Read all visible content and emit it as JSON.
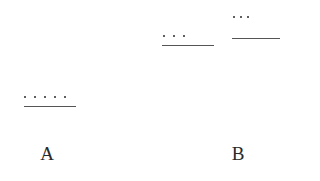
{
  "diagram": {
    "groups": [
      {
        "id": "A-group",
        "dot_count": 5,
        "dots_text": "•••••",
        "dots_y": 97,
        "dots_x_start": 24,
        "dot_spacing": 10,
        "line": {
          "x": 24,
          "y": 107,
          "width": 52
        }
      },
      {
        "id": "B-group-1",
        "dot_count": 3,
        "dots_text": "•••",
        "dots_y": 36,
        "dots_x_start": 163,
        "dot_spacing": 10,
        "line": {
          "x": 162,
          "y": 46,
          "width": 52
        }
      },
      {
        "id": "B-group-2",
        "dot_count": 3,
        "dots_text": "•••",
        "dots_y": 17,
        "dots_x_start": 233,
        "dot_spacing": 8,
        "line": {
          "x": 232,
          "y": 39,
          "width": 48
        }
      }
    ],
    "labels": [
      {
        "text": "A",
        "x": 47,
        "y": 145
      },
      {
        "text": "B",
        "x": 238,
        "y": 145
      }
    ],
    "colors": {
      "dot": "#2a2a2a",
      "line": "#555555",
      "text": "#2a2a2a",
      "background": "#ffffff"
    }
  }
}
